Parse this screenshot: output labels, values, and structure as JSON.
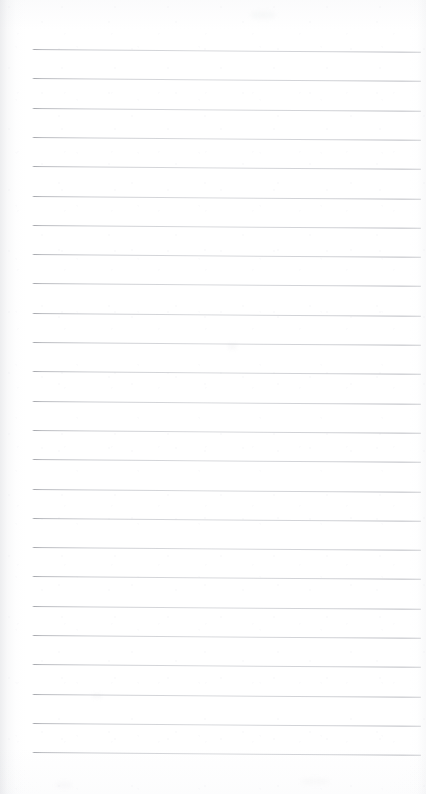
{
  "document": {
    "kind": "scanned-ruled-notepad-page",
    "caption": "Blank lined notepad page",
    "page_width": 426,
    "page_height": 794,
    "background_color": "#ffffff",
    "content_text": "",
    "has_handwriting": false,
    "has_printed_text": false
  },
  "ruling": {
    "line_color": "#b8babf",
    "line_color_dark_end": "#96989e",
    "line_count": 25,
    "line_thickness_px": 1,
    "first_line_y": 49,
    "line_spacing_px": 29.3,
    "left_margin_x": 32,
    "right_margin_x": 421,
    "line_length_px": 389,
    "skew_degrees": 0.42,
    "lines": [
      {
        "index": 1,
        "y": 49.0,
        "x": 32,
        "length": 389
      },
      {
        "index": 2,
        "y": 78.3,
        "x": 32,
        "length": 389
      },
      {
        "index": 3,
        "y": 107.6,
        "x": 32,
        "length": 389
      },
      {
        "index": 4,
        "y": 136.9,
        "x": 32,
        "length": 389
      },
      {
        "index": 5,
        "y": 166.2,
        "x": 32,
        "length": 389
      },
      {
        "index": 6,
        "y": 195.5,
        "x": 32,
        "length": 389
      },
      {
        "index": 7,
        "y": 224.8,
        "x": 32,
        "length": 389
      },
      {
        "index": 8,
        "y": 254.1,
        "x": 32,
        "length": 389
      },
      {
        "index": 9,
        "y": 283.4,
        "x": 32,
        "length": 389
      },
      {
        "index": 10,
        "y": 312.7,
        "x": 32,
        "length": 389
      },
      {
        "index": 11,
        "y": 342.0,
        "x": 32,
        "length": 389
      },
      {
        "index": 12,
        "y": 371.3,
        "x": 32,
        "length": 389
      },
      {
        "index": 13,
        "y": 400.6,
        "x": 32,
        "length": 389
      },
      {
        "index": 14,
        "y": 429.9,
        "x": 32,
        "length": 389
      },
      {
        "index": 15,
        "y": 459.2,
        "x": 32,
        "length": 389
      },
      {
        "index": 16,
        "y": 488.5,
        "x": 32,
        "length": 389
      },
      {
        "index": 17,
        "y": 517.8,
        "x": 32,
        "length": 389
      },
      {
        "index": 18,
        "y": 547.1,
        "x": 32,
        "length": 389
      },
      {
        "index": 19,
        "y": 576.4,
        "x": 32,
        "length": 389
      },
      {
        "index": 20,
        "y": 605.7,
        "x": 32,
        "length": 389
      },
      {
        "index": 21,
        "y": 635.0,
        "x": 32,
        "length": 389
      },
      {
        "index": 22,
        "y": 664.3,
        "x": 32,
        "length": 389
      },
      {
        "index": 23,
        "y": 693.6,
        "x": 32,
        "length": 389
      },
      {
        "index": 24,
        "y": 722.9,
        "x": 32,
        "length": 389
      },
      {
        "index": 25,
        "y": 752.2,
        "x": 32,
        "length": 389
      }
    ]
  },
  "artifacts": {
    "smudges": [
      {
        "x": 228,
        "y": 344,
        "w": 9,
        "h": 5,
        "opacity": 0.1
      },
      {
        "x": 250,
        "y": 11,
        "w": 26,
        "h": 8,
        "opacity": 0.07
      },
      {
        "x": 92,
        "y": 694,
        "w": 10,
        "h": 4,
        "opacity": 0.09
      },
      {
        "x": 55,
        "y": 782,
        "w": 18,
        "h": 6,
        "opacity": 0.06
      },
      {
        "x": 300,
        "y": 778,
        "w": 30,
        "h": 7,
        "opacity": 0.05
      }
    ]
  }
}
